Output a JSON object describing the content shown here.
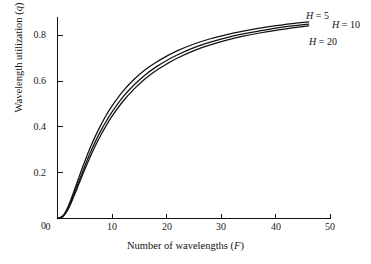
{
  "chart_data": {
    "type": "line",
    "title": "",
    "xlabel": "Number of wavelengths (F)",
    "xlabel_text": "Number of wavelengths (",
    "xlabel_symbol": "F",
    "xlabel_tail": ")",
    "ylabel": "Wavelength utilization (q)",
    "ylabel_text": "Wavelength utilization (",
    "ylabel_symbol": "q",
    "ylabel_tail": ")",
    "xlim": [
      0,
      50
    ],
    "ylim": [
      0,
      0.9
    ],
    "grid": false,
    "legend_position": "right-inline-annotations",
    "xticks": [
      0,
      10,
      20,
      30,
      40,
      50
    ],
    "xtick_labels": [
      "0",
      "10",
      "20",
      "30",
      "40",
      "50"
    ],
    "yticks": [
      0,
      0.2,
      0.4,
      0.6,
      0.8
    ],
    "ytick_labels": [
      "0",
      "0.2",
      "0.4",
      "0.6",
      "0.8"
    ],
    "x": [
      0,
      1,
      2,
      3,
      4,
      5,
      6,
      7,
      8,
      9,
      10,
      12,
      14,
      16,
      18,
      20,
      22,
      25,
      28,
      31,
      34,
      37,
      40,
      43,
      46
    ],
    "series": [
      {
        "name": "H = 5",
        "label_prefix": "H",
        "label_equals": " = ",
        "label_value": "5",
        "color": "#111111",
        "values": [
          0.0,
          0.012,
          0.055,
          0.118,
          0.185,
          0.25,
          0.31,
          0.363,
          0.411,
          0.454,
          0.492,
          0.556,
          0.607,
          0.648,
          0.681,
          0.709,
          0.733,
          0.762,
          0.785,
          0.803,
          0.818,
          0.831,
          0.842,
          0.851,
          0.859
        ]
      },
      {
        "name": "H = 10",
        "label_prefix": "H",
        "label_equals": " = ",
        "label_value": "10",
        "color": "#111111",
        "values": [
          0.0,
          0.01,
          0.048,
          0.106,
          0.168,
          0.229,
          0.287,
          0.339,
          0.386,
          0.428,
          0.466,
          0.531,
          0.583,
          0.626,
          0.661,
          0.69,
          0.715,
          0.746,
          0.77,
          0.79,
          0.806,
          0.819,
          0.831,
          0.841,
          0.849
        ]
      },
      {
        "name": "H = 20",
        "label_prefix": "H",
        "label_equals": " = ",
        "label_value": "20",
        "color": "#111111",
        "values": [
          0.0,
          0.009,
          0.043,
          0.097,
          0.156,
          0.214,
          0.27,
          0.321,
          0.367,
          0.409,
          0.447,
          0.512,
          0.565,
          0.609,
          0.645,
          0.675,
          0.701,
          0.733,
          0.758,
          0.779,
          0.796,
          0.81,
          0.822,
          0.832,
          0.841
        ]
      }
    ],
    "annotations": [
      {
        "text": "H = 5",
        "x_px": 306,
        "y_px": 11
      },
      {
        "text": "H = 10",
        "x_px": 332,
        "y_px": 20
      },
      {
        "text": "H = 20",
        "x_px": 309,
        "y_px": 37
      }
    ]
  }
}
